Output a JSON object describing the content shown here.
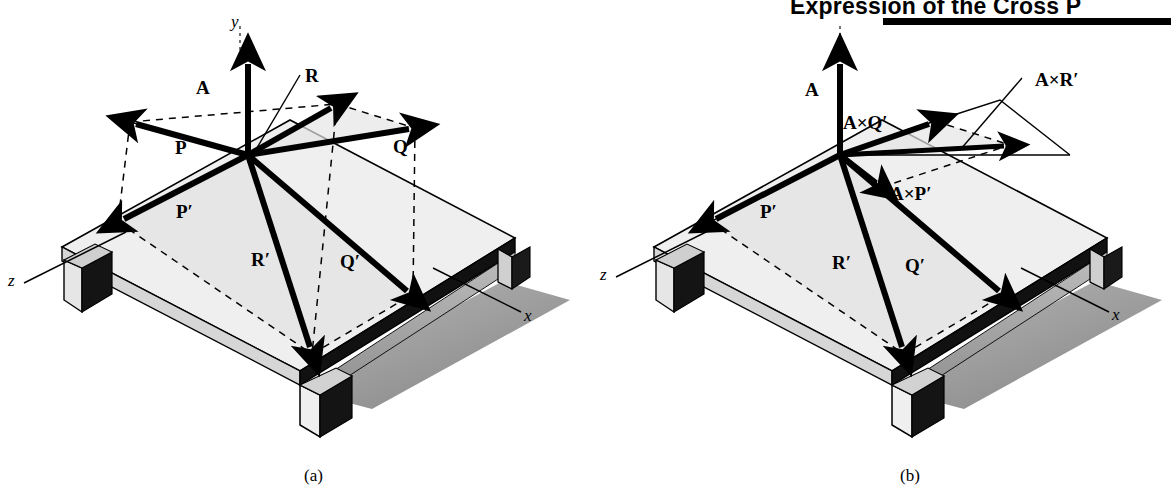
{
  "header": {
    "title": "Expression of the Cross P",
    "rule_color": "#000000"
  },
  "figure": {
    "caption_a": "(a)",
    "caption_b": "(b)"
  },
  "colors": {
    "ink": "#000000",
    "table_top": "#eeeeee",
    "table_edge_light": "#d8d8d8",
    "table_shadow": "#9a9a9a",
    "table_shadow_dark": "#6e6e6e",
    "parallelogram_fill": "#e4e4e4"
  },
  "panel_a": {
    "name": "diagram-a",
    "axes": [
      {
        "id": "y",
        "label": "y",
        "x": 231,
        "y": 13
      },
      {
        "id": "z",
        "label": "z",
        "x": 8,
        "y": 272
      },
      {
        "id": "x",
        "label": "x",
        "x": 524,
        "y": 307
      }
    ],
    "vectors": [
      {
        "id": "A",
        "label": "A",
        "lx": 196,
        "ly": 78,
        "x1": 248,
        "y1": 155,
        "x2": 248,
        "y2": 58
      },
      {
        "id": "R",
        "label": "R",
        "lx": 305,
        "ly": 66,
        "x1": 248,
        "y1": 155,
        "x2": 337,
        "y2": 104
      },
      {
        "id": "P",
        "label": "P",
        "lx": 175,
        "ly": 138,
        "x1": 248,
        "y1": 155,
        "x2": 130,
        "y2": 122
      },
      {
        "id": "Q",
        "label": "Q",
        "lx": 393,
        "ly": 137,
        "x1": 248,
        "y1": 155,
        "x2": 415,
        "y2": 128
      },
      {
        "id": "Pp",
        "label": "P′",
        "lx": 176,
        "ly": 202,
        "x1": 248,
        "y1": 155,
        "x2": 118,
        "y2": 222
      },
      {
        "id": "Rp",
        "label": "R′",
        "lx": 251,
        "ly": 250,
        "x1": 248,
        "y1": 155,
        "x2": 312,
        "y2": 354
      },
      {
        "id": "Qp",
        "label": "Q′",
        "lx": 340,
        "ly": 252,
        "x1": 248,
        "y1": 155,
        "x2": 413,
        "y2": 294
      }
    ],
    "leader": {
      "from_x": 300,
      "from_y": 75,
      "to_x": 248,
      "to_y": 165
    }
  },
  "panel_b": {
    "name": "diagram-b",
    "axes": [
      {
        "id": "z",
        "label": "z",
        "x": 600,
        "y": 266
      },
      {
        "id": "x",
        "label": "x",
        "x": 1112,
        "y": 306
      }
    ],
    "vectors": [
      {
        "id": "A",
        "label": "A",
        "lx": 805,
        "ly": 80,
        "x1": 840,
        "y1": 155,
        "x2": 840,
        "y2": 58
      },
      {
        "id": "AxQp",
        "label": "A×Q′",
        "lx": 843,
        "ly": 113,
        "x1": 840,
        "y1": 155,
        "x2": 935,
        "y2": 121
      },
      {
        "id": "AxPp",
        "label": "A×P′",
        "lx": 890,
        "ly": 184,
        "x1": 840,
        "y1": 155,
        "x2": 882,
        "y2": 187
      },
      {
        "id": "AxRp",
        "label": "A×R′",
        "lx": 1035,
        "ly": 70,
        "x1": 840,
        "y1": 155,
        "x2": 1010,
        "y2": 145
      },
      {
        "id": "Pp",
        "label": "P′",
        "lx": 760,
        "ly": 202,
        "x1": 840,
        "y1": 155,
        "x2": 710,
        "y2": 222
      },
      {
        "id": "Rp",
        "label": "R′",
        "lx": 832,
        "ly": 253,
        "x1": 840,
        "y1": 155,
        "x2": 904,
        "y2": 354
      },
      {
        "id": "Qp",
        "label": "Q′",
        "lx": 905,
        "ly": 256,
        "x1": 840,
        "y1": 155,
        "x2": 1005,
        "y2": 294
      }
    ],
    "leader": {
      "from_x": 1022,
      "from_y": 78,
      "to_x": 960,
      "to_y": 148
    }
  }
}
